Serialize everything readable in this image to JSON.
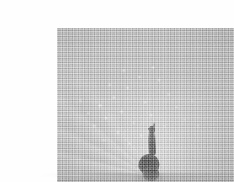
{
  "page": {
    "background_color": "#ffffff",
    "width": 234,
    "height": 182
  },
  "figure": {
    "kind": "halftone-photograph",
    "frame": {
      "x": 17,
      "y": 12,
      "width": 196,
      "height": 158
    },
    "tones": {
      "paper": "#ffffff",
      "photo_base": "#c6c6c6",
      "fan_highlight": "#f2f2f2",
      "midtone": "#b4b4b4",
      "shadow": "#5a5a5a",
      "bird_dark": "#262626"
    },
    "elements": [
      {
        "name": "tail-fan",
        "description": "broad pale fan of feathers radiating upward and outward"
      },
      {
        "name": "feather-eyespots",
        "description": "scattered bright speckles across the fan"
      },
      {
        "name": "feather-shafts",
        "description": "fine radiating lines converging at the bird's body"
      },
      {
        "name": "bird-head",
        "description": "small dark head with crest at top of the neck"
      },
      {
        "name": "bird-neck",
        "description": "narrow dark vertical neck"
      },
      {
        "name": "bird-body",
        "description": "dark rounded body mass at the base of the fan"
      },
      {
        "name": "ground-shadow",
        "description": "soft dark band beneath the bird"
      }
    ],
    "caption": ""
  }
}
